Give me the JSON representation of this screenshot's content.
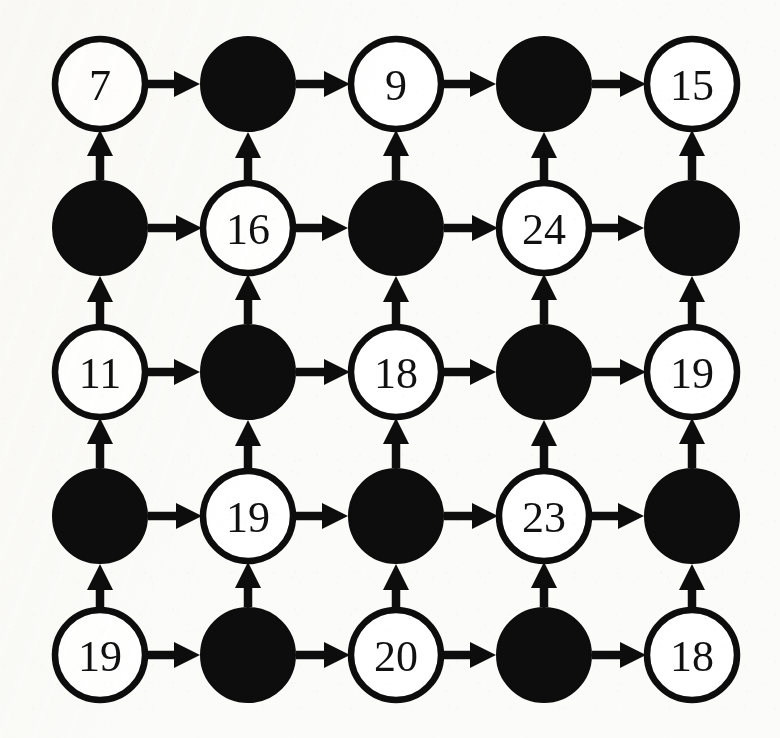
{
  "diagram": {
    "kind": "grid-graph",
    "rows": 5,
    "cols": 5,
    "colors": {
      "background": "#fbfbf9",
      "ink": "#0d0d0d",
      "open_node_fill": "#ffffff",
      "filled_node_fill": "#0d0d0d"
    },
    "geometry": {
      "col_centers": [
        100,
        248,
        396,
        544,
        692
      ],
      "row_centers": [
        84,
        228,
        372,
        516,
        655
      ],
      "node_radius": 45,
      "node_radius_filled": 47
    },
    "edges": {
      "horizontal_direction": "right",
      "vertical_direction": "up",
      "style": "solid-arrow"
    },
    "nodes": [
      [
        {
          "id": "r1c1",
          "type": "open",
          "label": "7"
        },
        {
          "id": "r1c2",
          "type": "filled",
          "label": ""
        },
        {
          "id": "r1c3",
          "type": "open",
          "label": "9"
        },
        {
          "id": "r1c4",
          "type": "filled",
          "label": ""
        },
        {
          "id": "r1c5",
          "type": "open",
          "label": "15"
        }
      ],
      [
        {
          "id": "r2c1",
          "type": "filled",
          "label": ""
        },
        {
          "id": "r2c2",
          "type": "open",
          "label": "16"
        },
        {
          "id": "r2c3",
          "type": "filled",
          "label": ""
        },
        {
          "id": "r2c4",
          "type": "open",
          "label": "24"
        },
        {
          "id": "r2c5",
          "type": "filled",
          "label": ""
        }
      ],
      [
        {
          "id": "r3c1",
          "type": "open",
          "label": "11"
        },
        {
          "id": "r3c2",
          "type": "filled",
          "label": ""
        },
        {
          "id": "r3c3",
          "type": "open",
          "label": "18"
        },
        {
          "id": "r3c4",
          "type": "filled",
          "label": ""
        },
        {
          "id": "r3c5",
          "type": "open",
          "label": "19"
        }
      ],
      [
        {
          "id": "r4c1",
          "type": "filled",
          "label": ""
        },
        {
          "id": "r4c2",
          "type": "open",
          "label": "19"
        },
        {
          "id": "r4c3",
          "type": "filled",
          "label": ""
        },
        {
          "id": "r4c4",
          "type": "open",
          "label": "23"
        },
        {
          "id": "r4c5",
          "type": "filled",
          "label": ""
        }
      ],
      [
        {
          "id": "r5c1",
          "type": "open",
          "label": "19"
        },
        {
          "id": "r5c2",
          "type": "filled",
          "label": ""
        },
        {
          "id": "r5c3",
          "type": "open",
          "label": "20"
        },
        {
          "id": "r5c4",
          "type": "filled",
          "label": ""
        },
        {
          "id": "r5c5",
          "type": "open",
          "label": "18"
        }
      ]
    ]
  }
}
